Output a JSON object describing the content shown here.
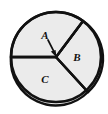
{
  "figure": {
    "name": "circle-sector-diagram",
    "background_color": "#ffffff",
    "sector_fill_color": "#ebebeb",
    "outline_color": "#111111",
    "label_color": "#111111",
    "circle": {
      "center_x": 56,
      "center_y": 57,
      "radius": 45,
      "stroke_width": 2.4
    },
    "sectors": [
      {
        "id": "A",
        "label": "A",
        "label_x": 45,
        "label_y": 39,
        "start_angle_deg": -41,
        "end_angle_deg": 50,
        "description": "small top sector indicated by arrow",
        "callout": true
      },
      {
        "id": "B",
        "label": "B",
        "label_x": 77,
        "label_y": 60,
        "start_angle_deg": -41,
        "end_angle_deg": 39,
        "description": "right sector"
      },
      {
        "id": "C",
        "label": "C",
        "label_x": 45,
        "label_y": 82,
        "start_angle_deg": 39,
        "end_angle_deg": 180,
        "description": "large lower-left sector"
      }
    ],
    "radii": [
      {
        "id": "radius-left",
        "to_x": 11,
        "to_y": 57
      },
      {
        "id": "radius-upper-right",
        "to_x": 83,
        "to_y": 21
      },
      {
        "id": "radius-lower-right",
        "to_x": 88,
        "to_y": 92
      }
    ],
    "arrow": {
      "id": "callout-arrow-a",
      "from_x": 48,
      "from_y": 41,
      "to_x": 56,
      "to_y": 56,
      "stroke_width": 1.6
    }
  }
}
